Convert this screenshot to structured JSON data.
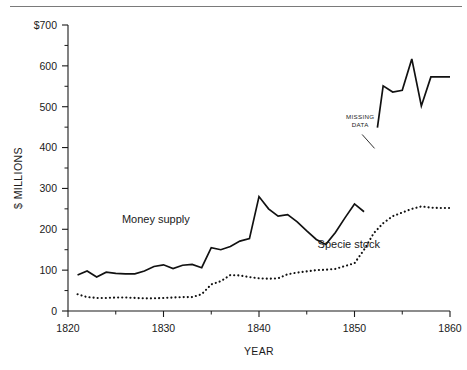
{
  "figure": {
    "top_rule": true,
    "background_color": "#ffffff",
    "ink_color": "#1a1a1a"
  },
  "chart_data": {
    "type": "line",
    "title": "",
    "subtitle": "",
    "xlabel": "YEAR",
    "ylabel": "$ MILLIONS",
    "xlim": [
      1820,
      1860
    ],
    "ylim": [
      0,
      700
    ],
    "grid": false,
    "legend_position": "inline-annotation",
    "x_ticks": [
      1820,
      1830,
      1840,
      1850,
      1860
    ],
    "x_tick_labels": [
      "1820",
      "1830",
      "1840",
      "1850",
      "1860"
    ],
    "x_minor_ticks": [
      1825,
      1835,
      1845,
      1855
    ],
    "y_ticks": [
      0,
      100,
      200,
      300,
      400,
      500,
      600,
      700
    ],
    "y_tick_labels": [
      "0",
      "100",
      "200",
      "300",
      "400",
      "500",
      "600",
      "$700"
    ],
    "y_minor_ticks": [
      50,
      150,
      250,
      350,
      450,
      550,
      650
    ],
    "series": [
      {
        "name": "Money supply",
        "style": "solid",
        "color": "#111111",
        "label_x": 1829.2,
        "label_y": 215,
        "segments": [
          {
            "x": [
              1821,
              1822,
              1823,
              1824,
              1825,
              1826,
              1827,
              1828,
              1829,
              1830,
              1831,
              1832,
              1833,
              1834,
              1835,
              1836,
              1837,
              1838,
              1839,
              1840,
              1841,
              1842,
              1843,
              1844,
              1845,
              1846,
              1847,
              1848,
              1849,
              1850,
              1851
            ],
            "y": [
              88,
              98,
              83,
              95,
              92,
              91,
              91,
              98,
              109,
              113,
              104,
              112,
              114,
              106,
              155,
              150,
              158,
              171,
              177,
              280,
              250,
              232,
              236,
              218,
              196,
              175,
              163,
              192,
              228,
              262,
              243
            ]
          },
          {
            "x": [
              1852.4,
              1853,
              1854,
              1855,
              1856,
              1857,
              1858,
              1859,
              1860
            ],
            "y": [
              449,
              551,
              536,
              540,
              617,
              502,
              573,
              573,
              573
            ]
          }
        ],
        "gap_note": "break between 1851 and 1852 — MISSING DATA"
      },
      {
        "name": "Specie stock",
        "style": "dotted",
        "color": "#111111",
        "label_x": 1849.4,
        "label_y": 155,
        "segments": [
          {
            "x": [
              1821,
              1822,
              1823,
              1824,
              1825,
              1826,
              1827,
              1828,
              1829,
              1830,
              1831,
              1832,
              1833,
              1834,
              1835,
              1836,
              1837,
              1838,
              1839,
              1840,
              1841,
              1842,
              1843,
              1844,
              1845,
              1846,
              1847,
              1848,
              1849,
              1850,
              1851,
              1852,
              1853,
              1854,
              1855,
              1856,
              1857,
              1858,
              1859,
              1860
            ],
            "y": [
              41,
              34,
              32,
              32,
              33,
              33,
              32,
              31,
              31,
              32,
              33,
              34,
              34,
              41,
              65,
              73,
              88,
              87,
              83,
              80,
              79,
              80,
              90,
              94,
              97,
              100,
              101,
              103,
              110,
              117,
              150,
              190,
              215,
              232,
              241,
              250,
              256,
              253,
              252,
              252
            ]
          }
        ]
      }
    ],
    "annotations": [
      {
        "name": "missing-data",
        "text_lines": [
          "MISSING",
          "DATA"
        ],
        "text_x": 1850.6,
        "text_y": 470,
        "leader_from_x": 1850.8,
        "leader_from_y": 432,
        "leader_to_x": 1852.1,
        "leader_to_y": 398
      }
    ]
  }
}
